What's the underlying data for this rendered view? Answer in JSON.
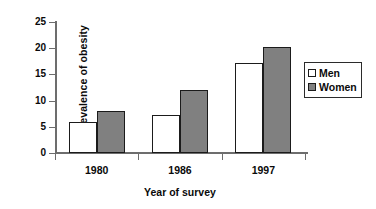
{
  "chart_data": {
    "type": "bar",
    "title": "",
    "xlabel": "Year of survey",
    "ylabel": "Prevalence of obesity",
    "categories": [
      "1980",
      "1986",
      "1997"
    ],
    "series": [
      {
        "name": "Men",
        "values": [
          6.0,
          7.2,
          17.2
        ],
        "color": "#ffffff"
      },
      {
        "name": "Women",
        "values": [
          8.1,
          12.1,
          20.2
        ],
        "color": "#808080"
      }
    ],
    "ylim": [
      0,
      25
    ],
    "ytick_values": [
      0,
      5,
      10,
      15,
      20,
      25
    ],
    "ytick_labels": [
      "0",
      "5",
      "10",
      "15",
      "20",
      "25"
    ],
    "grid": false,
    "legend_position": "right",
    "legend_entries": [
      "Men",
      "Women"
    ],
    "axis_color": "#6d6d6d",
    "bar_outline_color": "#1b1b1b",
    "background": "#ffffff"
  }
}
